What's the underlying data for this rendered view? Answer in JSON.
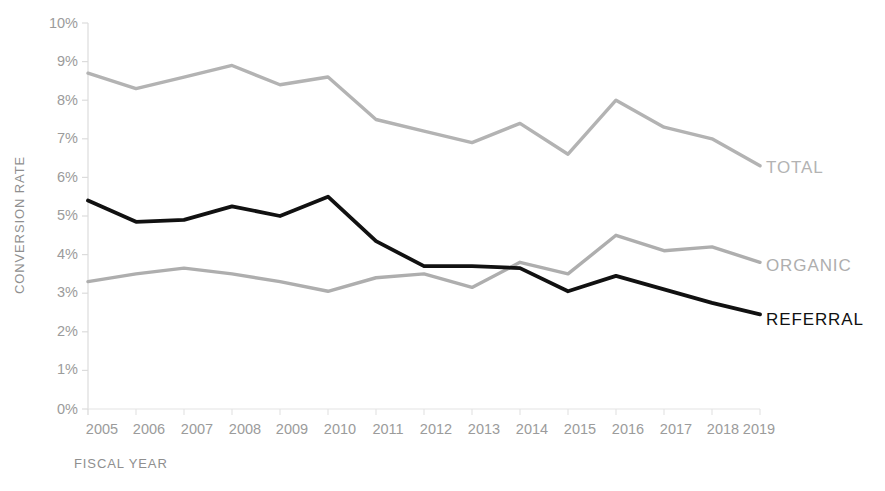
{
  "chart_data": {
    "type": "line",
    "title": "",
    "subtitle": "",
    "xlabel": "FISCAL YEAR",
    "ylabel": "CONVERSION RATE",
    "categories": [
      "2005",
      "2006",
      "2007",
      "2008",
      "2009",
      "2010",
      "2011",
      "2012",
      "2013",
      "2014",
      "2015",
      "2016",
      "2017",
      "2018",
      "2019"
    ],
    "x": [
      2005,
      2006,
      2007,
      2008,
      2009,
      2010,
      2011,
      2012,
      2013,
      2014,
      2015,
      2016,
      2017,
      2018,
      2019
    ],
    "ylim": [
      0,
      10
    ],
    "xlim": [
      2005,
      2019
    ],
    "y_tick_labels": [
      "0%",
      "1%",
      "2%",
      "3%",
      "4%",
      "5%",
      "6%",
      "7%",
      "8%",
      "9%",
      "10%"
    ],
    "y_tick_values": [
      0,
      1,
      2,
      3,
      4,
      5,
      6,
      7,
      8,
      9,
      10
    ],
    "y_unit": "%",
    "grid": false,
    "legend_position": "right-inline",
    "series": [
      {
        "name": "TOTAL",
        "color": "#b3b3b3",
        "values": [
          8.7,
          8.3,
          8.6,
          8.9,
          8.4,
          8.6,
          7.5,
          7.2,
          6.9,
          7.4,
          6.6,
          8.0,
          7.3,
          7.0,
          6.3
        ]
      },
      {
        "name": "ORGANIC",
        "color": "#aeaeae",
        "values": [
          3.3,
          3.5,
          3.65,
          3.5,
          3.3,
          3.05,
          3.4,
          3.5,
          3.15,
          3.8,
          3.5,
          4.5,
          4.1,
          4.2,
          3.8
        ]
      },
      {
        "name": "REFERRAL",
        "color": "#111111",
        "values": [
          5.4,
          4.85,
          4.9,
          5.25,
          5.0,
          5.5,
          4.35,
          3.7,
          3.7,
          3.65,
          3.05,
          3.45,
          3.1,
          2.75,
          2.45
        ]
      }
    ],
    "annotations": []
  },
  "labels": {
    "y_axis_title": "CONVERSION RATE",
    "x_axis_title": "FISCAL YEAR",
    "series_total": "TOTAL",
    "series_organic": "ORGANIC",
    "series_referral": "REFERRAL",
    "y0": "0%",
    "y1": "1%",
    "y2": "2%",
    "y3": "3%",
    "y4": "4%",
    "y5": "5%",
    "y6": "6%",
    "y7": "7%",
    "y8": "8%",
    "y9": "9%",
    "y10": "10%",
    "x0": "2005",
    "x1": "2006",
    "x2": "2007",
    "x3": "2008",
    "x4": "2009",
    "x5": "2010",
    "x6": "2011",
    "x7": "2012",
    "x8": "2013",
    "x9": "2014",
    "x10": "2015",
    "x11": "2016",
    "x12": "2017",
    "x13": "2018",
    "x14": "2019"
  },
  "colors": {
    "total": "#b3b3b3",
    "organic": "#aeaeae",
    "referral": "#111111",
    "axis": "#d8d8d8",
    "tick_text": "#9b9b9b",
    "title_text": "#8f8f8f",
    "background": "#ffffff"
  }
}
